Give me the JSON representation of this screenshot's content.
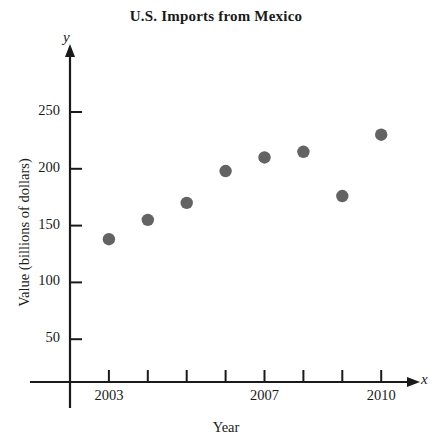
{
  "chart_data": {
    "type": "scatter",
    "title": "U.S. Imports from Mexico",
    "xlabel": "Year",
    "ylabel": "Value (billions of dollars)",
    "x_axis_variable": "x",
    "y_axis_variable": "y",
    "x": [
      2003,
      2004,
      2005,
      2006,
      2007,
      2008,
      2009,
      2010
    ],
    "values": [
      138,
      155,
      170,
      198,
      210,
      215,
      176,
      230
    ],
    "points": [
      {
        "x": 2003,
        "y": 138
      },
      {
        "x": 2004,
        "y": 155
      },
      {
        "x": 2005,
        "y": 170
      },
      {
        "x": 2006,
        "y": 198
      },
      {
        "x": 2007,
        "y": 210
      },
      {
        "x": 2008,
        "y": 215
      },
      {
        "x": 2009,
        "y": 176
      },
      {
        "x": 2010,
        "y": 230
      }
    ],
    "xlim": [
      2002,
      2011
    ],
    "ylim": [
      0,
      275
    ],
    "x_tick_values": [
      2002,
      2003,
      2004,
      2005,
      2006,
      2007,
      2008,
      2009,
      2010
    ],
    "x_tick_labels": [
      "",
      "2003",
      "",
      "",
      "",
      "2007",
      "",
      "",
      "2010"
    ],
    "x_labeled_ticks": [
      {
        "value": 2003,
        "label": "2003"
      },
      {
        "value": 2007,
        "label": "2007"
      },
      {
        "value": 2010,
        "label": "2010"
      }
    ],
    "y_tick_values": [
      50,
      100,
      150,
      200,
      250
    ],
    "y_tick_labels": [
      "50",
      "100",
      "150",
      "200",
      "250"
    ],
    "grid": false,
    "legend": null,
    "marker_color": "#636363",
    "axis_color": "#1a1a1a",
    "background_color": "#ffffff",
    "marker_shape": "circle"
  }
}
